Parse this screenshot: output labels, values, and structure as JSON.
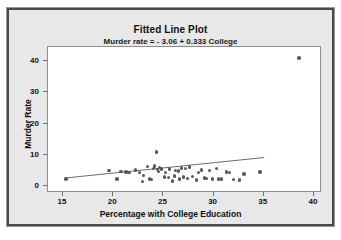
{
  "chart_data": {
    "type": "scatter",
    "title": "Fitted Line Plot",
    "subtitle": "Murder rate =  - 3.06 + 0.333 College",
    "xlabel": "Percentage with College Education",
    "ylabel": "Murder Rate",
    "xlim": [
      13.5,
      40.8
    ],
    "ylim": [
      -2.2,
      44.5
    ],
    "xticks": [
      15,
      20,
      25,
      30,
      35,
      40
    ],
    "yticks": [
      0,
      10,
      20,
      30,
      40
    ],
    "grid": false,
    "legend": null,
    "marker_color": "#555a60",
    "line_color": "#6a6a6a",
    "plot_background": "#ffffff",
    "figure_background": "#e8e8e8",
    "fit_line": {
      "equation": "Murder rate =  - 3.06 + 0.333 College",
      "intercept": -3.06,
      "slope": 0.333,
      "x_start": 15.3,
      "x_end": 35.2
    },
    "points": [
      [
        15.3,
        2.3
      ],
      [
        20.4,
        2.2
      ],
      [
        20.8,
        4.7
      ],
      [
        19.6,
        5.0
      ],
      [
        21.3,
        4.6
      ],
      [
        21.6,
        4.3
      ],
      [
        22.2,
        5.2
      ],
      [
        22.9,
        1.5
      ],
      [
        22.6,
        4.4
      ],
      [
        23.0,
        3.4
      ],
      [
        23.4,
        6.3
      ],
      [
        23.6,
        2.3
      ],
      [
        23.8,
        2.1
      ],
      [
        24.0,
        5.6
      ],
      [
        24.1,
        6.4
      ],
      [
        24.3,
        11.0
      ],
      [
        24.4,
        5.3
      ],
      [
        24.5,
        4.7
      ],
      [
        24.6,
        6.0
      ],
      [
        24.8,
        5.5
      ],
      [
        25.1,
        3.0
      ],
      [
        25.2,
        4.3
      ],
      [
        25.5,
        2.7
      ],
      [
        25.6,
        5.4
      ],
      [
        25.9,
        1.6
      ],
      [
        26.1,
        3.2
      ],
      [
        26.2,
        5.0
      ],
      [
        26.5,
        4.9
      ],
      [
        26.6,
        2.2
      ],
      [
        26.8,
        5.8
      ],
      [
        27.0,
        3.0
      ],
      [
        27.2,
        5.7
      ],
      [
        27.4,
        2.5
      ],
      [
        27.6,
        6.2
      ],
      [
        27.9,
        3.1
      ],
      [
        28.3,
        2.0
      ],
      [
        28.5,
        4.3
      ],
      [
        28.8,
        5.2
      ],
      [
        29.1,
        2.6
      ],
      [
        29.3,
        2.4
      ],
      [
        29.6,
        5.0
      ],
      [
        29.9,
        2.2
      ],
      [
        30.3,
        5.6
      ],
      [
        30.5,
        2.3
      ],
      [
        30.8,
        2.2
      ],
      [
        31.3,
        4.5
      ],
      [
        31.6,
        4.3
      ],
      [
        32.0,
        2.1
      ],
      [
        32.6,
        2.0
      ],
      [
        33.0,
        3.8
      ],
      [
        34.6,
        4.6
      ],
      [
        38.5,
        41.0
      ]
    ]
  }
}
